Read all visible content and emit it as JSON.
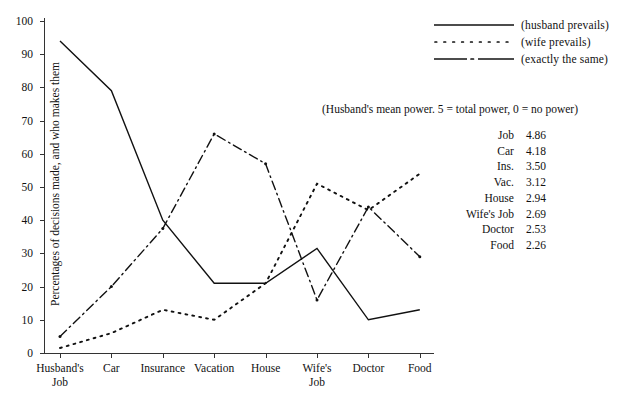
{
  "chart_data": {
    "type": "line",
    "title": "",
    "xlabel": "",
    "ylabel": "Percentages of decisions made, and who makes them",
    "ylim": [
      0,
      100
    ],
    "yticks": [
      0,
      10,
      20,
      30,
      40,
      50,
      60,
      70,
      80,
      90,
      100
    ],
    "grid": false,
    "legend_position": "top-right",
    "categories": [
      "Husband's Job",
      "Car",
      "Insurance",
      "Vacation",
      "House",
      "Wife's Job",
      "Doctor",
      "Food"
    ],
    "series": [
      {
        "name": "(husband prevails)",
        "style": "solid",
        "values": [
          94,
          79,
          40,
          21,
          21,
          31.5,
          10,
          13
        ]
      },
      {
        "name": "(wife prevails)",
        "style": "dotted",
        "values": [
          1.5,
          6,
          13,
          10,
          21,
          51,
          43,
          54
        ]
      },
      {
        "name": "(exactly the same)",
        "style": "dash-dot",
        "values": [
          5,
          20,
          37.5,
          66,
          57,
          16,
          44,
          29
        ]
      }
    ],
    "annotation": "(Husband's mean power.  5 = total power, 0 = no power)",
    "power_table": {
      "rows": [
        {
          "label": "Job",
          "value": "4.86"
        },
        {
          "label": "Car",
          "value": "4.18"
        },
        {
          "label": "Ins.",
          "value": "3.50"
        },
        {
          "label": "Vac.",
          "value": "3.12"
        },
        {
          "label": "House",
          "value": "2.94"
        },
        {
          "label": "Wife's Job",
          "value": "2.69"
        },
        {
          "label": "Doctor",
          "value": "2.53"
        },
        {
          "label": "Food",
          "value": "2.26"
        }
      ]
    },
    "colors": {
      "ink": "#111111",
      "axis": "#333333",
      "background": "#ffffff"
    }
  },
  "axis": {
    "y_tick_labels": [
      "0",
      "10",
      "20",
      "30",
      "40",
      "50",
      "60",
      "70",
      "80",
      "90",
      "100"
    ],
    "y_title": "Percentages of decisions made, and who makes them",
    "x_tick_labels": [
      "Husband's\nJob",
      "Car",
      "Insurance",
      "Vacation",
      "House",
      "Wife's\nJob",
      "Doctor",
      "Food"
    ]
  },
  "legend": {
    "items": [
      {
        "label": "(husband prevails)",
        "icon": "solid-line-icon"
      },
      {
        "label": "(wife prevails)",
        "icon": "dotted-line-icon"
      },
      {
        "label": "(exactly the same)",
        "icon": "dash-dot-line-icon"
      }
    ]
  }
}
